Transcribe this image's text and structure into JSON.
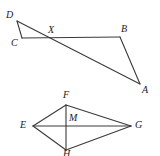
{
  "figure": {
    "background_color": "#ffffff",
    "stroke_color": "#3a3a3a",
    "label_color": "#1a1a1a",
    "label_style": "italic-serif",
    "canvas": {
      "width": 160,
      "height": 156
    }
  },
  "diagrams": [
    {
      "name": "triangle-dab-with-transversal-cb",
      "type": "line-diagram",
      "points": [
        {
          "id": "D",
          "label": "D",
          "x": 17,
          "y": 21,
          "label_x": 6,
          "label_y": 10
        },
        {
          "id": "C",
          "label": "C",
          "x": 22,
          "y": 38,
          "label_x": 11,
          "label_y": 38
        },
        {
          "id": "X",
          "label": "X",
          "x": 50,
          "y": 37,
          "label_x": 48,
          "label_y": 25
        },
        {
          "id": "B",
          "label": "B",
          "x": 120,
          "y": 37,
          "label_x": 121,
          "label_y": 24
        },
        {
          "id": "A",
          "label": "A",
          "x": 140,
          "y": 84,
          "label_x": 142,
          "label_y": 85
        }
      ],
      "segments": [
        {
          "from": "D",
          "to": "C"
        },
        {
          "from": "D",
          "to": "A"
        },
        {
          "from": "C",
          "to": "B"
        },
        {
          "from": "B",
          "to": "A"
        }
      ]
    },
    {
      "name": "kite-efgh-with-center-m",
      "type": "line-diagram",
      "points": [
        {
          "id": "F",
          "label": "F",
          "x": 66,
          "y": 105,
          "label_x": 63,
          "label_y": 90
        },
        {
          "id": "E",
          "label": "E",
          "x": 33,
          "y": 126,
          "label_x": 20,
          "label_y": 120
        },
        {
          "id": "M",
          "label": "M",
          "x": 66,
          "y": 126,
          "label_x": 69,
          "label_y": 113
        },
        {
          "id": "G",
          "label": "G",
          "x": 131,
          "y": 126,
          "label_x": 135,
          "label_y": 120
        },
        {
          "id": "H",
          "label": "H",
          "x": 66,
          "y": 150,
          "label_x": 63,
          "label_y": 149
        }
      ],
      "segments": [
        {
          "from": "E",
          "to": "F"
        },
        {
          "from": "F",
          "to": "G"
        },
        {
          "from": "G",
          "to": "H"
        },
        {
          "from": "H",
          "to": "E"
        },
        {
          "from": "E",
          "to": "G"
        },
        {
          "from": "F",
          "to": "H"
        }
      ]
    }
  ]
}
